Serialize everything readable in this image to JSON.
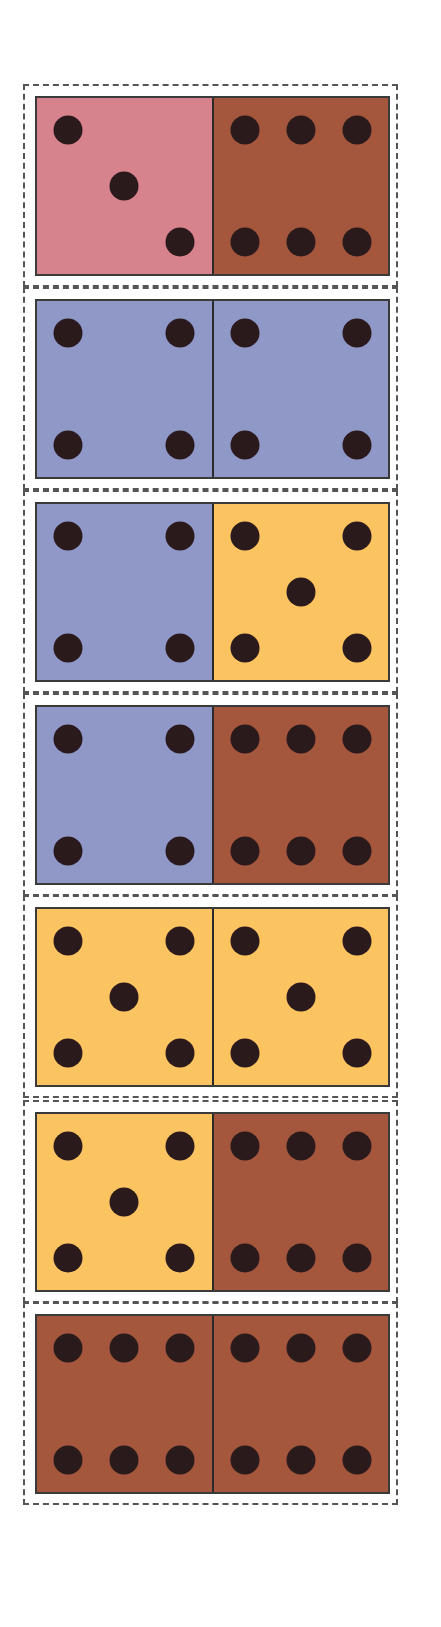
{
  "colors": {
    "pink": "#d7838e",
    "brown": "#a5573e",
    "blue": "#8f98c6",
    "yellow": "#fbc460",
    "pip": "#2a1a1c",
    "dash": "#555555"
  },
  "dominoes": [
    {
      "left": {
        "value": 3,
        "color": "pink"
      },
      "right": {
        "value": 6,
        "color": "brown"
      }
    },
    {
      "left": {
        "value": 4,
        "color": "blue"
      },
      "right": {
        "value": 4,
        "color": "blue"
      }
    },
    {
      "left": {
        "value": 4,
        "color": "blue"
      },
      "right": {
        "value": 5,
        "color": "yellow"
      }
    },
    {
      "left": {
        "value": 4,
        "color": "blue"
      },
      "right": {
        "value": 6,
        "color": "brown"
      }
    },
    {
      "left": {
        "value": 5,
        "color": "yellow"
      },
      "right": {
        "value": 5,
        "color": "yellow"
      }
    },
    {
      "left": {
        "value": 5,
        "color": "yellow"
      },
      "right": {
        "value": 6,
        "color": "brown"
      }
    },
    {
      "left": {
        "value": 6,
        "color": "brown"
      },
      "right": {
        "value": 6,
        "color": "brown"
      }
    }
  ]
}
